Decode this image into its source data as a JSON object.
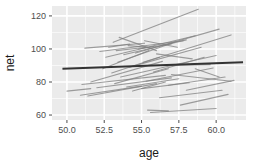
{
  "chart_data": {
    "type": "line",
    "title": "",
    "subtitle": "",
    "xlabel": "age",
    "ylabel": "net",
    "xlim": [
      49.0,
      62.0
    ],
    "ylim": [
      57.0,
      126.0
    ],
    "grid": true,
    "legend": false,
    "legend_position": "none",
    "xticks": [
      50.0,
      52.5,
      55.0,
      57.5,
      60.0
    ],
    "xtick_labels": [
      "50.0",
      "52.5",
      "55.0",
      "57.5",
      "60.0"
    ],
    "yticks": [
      60,
      80,
      100,
      120
    ],
    "ytick_labels": [
      "60",
      "80",
      "100",
      "120"
    ],
    "x_minor_ticks": [
      51.25,
      53.75,
      56.25,
      58.75,
      61.25
    ],
    "y_minor_ticks": [
      70,
      90,
      110,
      120
    ],
    "panel_background": "#ebebeb",
    "gridline_color": "#ffffff",
    "subject_line_color": "#808080",
    "trend_line_color": "#333333",
    "series": [
      {
        "name": "subject-01",
        "x": [
          50.0,
          51.6
        ],
        "values": [
          74.5,
          76.0
        ]
      },
      {
        "name": "subject-02",
        "x": [
          50.9,
          55.0
        ],
        "values": [
          72.0,
          77.5
        ]
      },
      {
        "name": "subject-03",
        "x": [
          51.0,
          56.6
        ],
        "values": [
          78.5,
          84.0
        ]
      },
      {
        "name": "subject-04",
        "x": [
          51.2,
          55.2
        ],
        "values": [
          100.5,
          103.5
        ]
      },
      {
        "name": "subject-05",
        "x": [
          51.4,
          56.0
        ],
        "values": [
          71.5,
          79.0
        ]
      },
      {
        "name": "subject-06",
        "x": [
          51.6,
          56.4
        ],
        "values": [
          80.0,
          92.5
        ]
      },
      {
        "name": "subject-07",
        "x": [
          52.0,
          57.0
        ],
        "values": [
          76.5,
          82.5
        ]
      },
      {
        "name": "subject-08",
        "x": [
          52.2,
          57.8
        ],
        "values": [
          98.5,
          105.0
        ]
      },
      {
        "name": "subject-09",
        "x": [
          52.4,
          55.5
        ],
        "values": [
          88.0,
          99.0
        ]
      },
      {
        "name": "subject-10",
        "x": [
          52.6,
          58.6
        ],
        "values": [
          95.0,
          108.0
        ]
      },
      {
        "name": "subject-11",
        "x": [
          52.8,
          54.2
        ],
        "values": [
          101.0,
          103.0
        ]
      },
      {
        "name": "subject-12",
        "x": [
          53.0,
          56.2
        ],
        "values": [
          85.5,
          95.0
        ]
      },
      {
        "name": "subject-13",
        "x": [
          53.1,
          58.8
        ],
        "values": [
          104.0,
          124.0
        ]
      },
      {
        "name": "subject-14",
        "x": [
          53.2,
          56.8
        ],
        "values": [
          79.0,
          88.0
        ]
      },
      {
        "name": "subject-15",
        "x": [
          53.3,
          55.8
        ],
        "values": [
          99.0,
          101.5
        ]
      },
      {
        "name": "subject-16",
        "x": [
          53.4,
          57.2
        ],
        "values": [
          92.0,
          104.0
        ]
      },
      {
        "name": "subject-17",
        "x": [
          53.5,
          56.0
        ],
        "values": [
          107.0,
          99.0
        ]
      },
      {
        "name": "subject-18",
        "x": [
          53.6,
          60.0
        ],
        "values": [
          83.0,
          96.0
        ]
      },
      {
        "name": "subject-19",
        "x": [
          53.8,
          58.0
        ],
        "values": [
          96.5,
          105.5
        ]
      },
      {
        "name": "subject-20",
        "x": [
          54.0,
          57.5
        ],
        "values": [
          77.0,
          82.0
        ]
      },
      {
        "name": "subject-21",
        "x": [
          54.1,
          55.4
        ],
        "values": [
          102.0,
          101.0
        ]
      },
      {
        "name": "subject-22",
        "x": [
          54.2,
          59.0
        ],
        "values": [
          89.0,
          101.0
        ]
      },
      {
        "name": "subject-23",
        "x": [
          54.4,
          56.6
        ],
        "values": [
          74.5,
          80.0
        ]
      },
      {
        "name": "subject-24",
        "x": [
          54.6,
          60.2
        ],
        "values": [
          97.5,
          112.0
        ]
      },
      {
        "name": "subject-25",
        "x": [
          54.8,
          57.0
        ],
        "values": [
          100.0,
          103.0
        ]
      },
      {
        "name": "subject-26",
        "x": [
          55.0,
          58.2
        ],
        "values": [
          76.0,
          79.5
        ]
      },
      {
        "name": "subject-27",
        "x": [
          55.1,
          61.0
        ],
        "values": [
          92.0,
          108.5
        ]
      },
      {
        "name": "subject-28",
        "x": [
          55.2,
          57.4
        ],
        "values": [
          105.0,
          101.0
        ]
      },
      {
        "name": "subject-29",
        "x": [
          55.3,
          59.8
        ],
        "values": [
          80.5,
          88.5
        ]
      },
      {
        "name": "subject-30",
        "x": [
          55.4,
          56.8
        ],
        "values": [
          63.0,
          62.5
        ]
      },
      {
        "name": "subject-31",
        "x": [
          55.6,
          60.0
        ],
        "values": [
          61.5,
          64.0
        ]
      },
      {
        "name": "subject-32",
        "x": [
          55.8,
          59.2
        ],
        "values": [
          86.0,
          95.0
        ]
      },
      {
        "name": "subject-33",
        "x": [
          56.0,
          58.4
        ],
        "values": [
          97.0,
          94.0
        ]
      },
      {
        "name": "subject-34",
        "x": [
          56.2,
          60.4
        ],
        "values": [
          70.5,
          75.0
        ]
      },
      {
        "name": "subject-35",
        "x": [
          56.4,
          59.6
        ],
        "values": [
          90.0,
          90.5
        ]
      },
      {
        "name": "subject-36",
        "x": [
          56.8,
          60.6
        ],
        "values": [
          78.0,
          83.0
        ]
      },
      {
        "name": "subject-37",
        "x": [
          57.0,
          61.0
        ],
        "values": [
          84.5,
          80.5
        ]
      },
      {
        "name": "subject-38",
        "x": [
          57.6,
          60.8
        ],
        "values": [
          66.0,
          72.5
        ]
      },
      {
        "name": "subject-39",
        "x": [
          58.0,
          61.2
        ],
        "values": [
          75.0,
          81.0
        ]
      },
      {
        "name": "subject-40",
        "x": [
          58.6,
          60.2
        ],
        "values": [
          88.0,
          83.0
        ]
      }
    ],
    "trend_line": {
      "name": "population-trend",
      "x": [
        49.7,
        61.8
      ],
      "values": [
        88.0,
        92.0
      ]
    }
  }
}
